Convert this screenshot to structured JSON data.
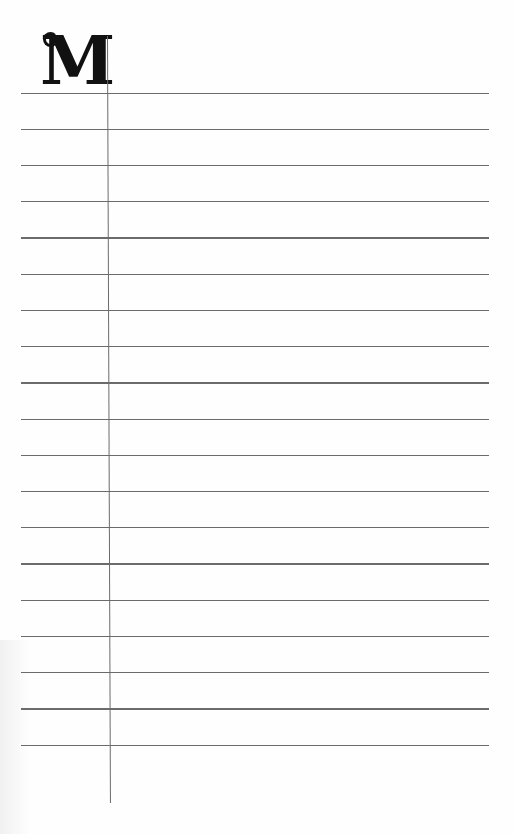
{
  "page": {
    "type": "lined notebook page",
    "initial_letter": "M",
    "ruled_line_count": 19,
    "colors": {
      "background": "#fefefe",
      "rule_lines": "#6b6b6b",
      "initial": "#111111"
    }
  }
}
